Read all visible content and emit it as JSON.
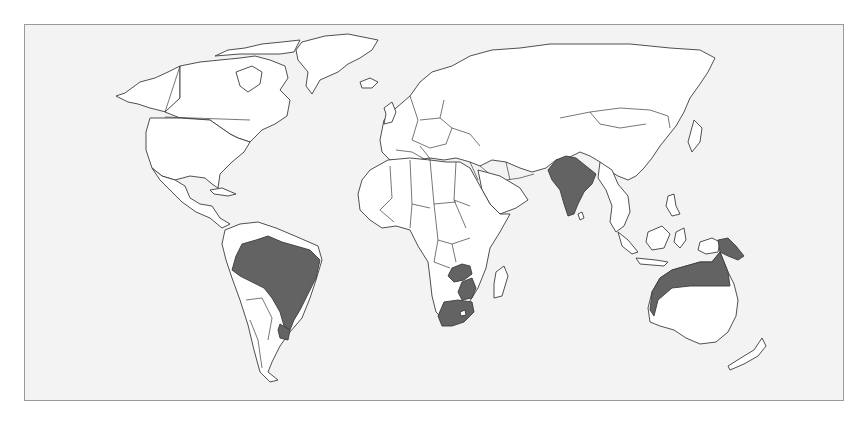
{
  "map": {
    "type": "world-choropleth",
    "projection": "equirectangular-like",
    "colors": {
      "background": "#f3f3f3",
      "land": "#ffffff",
      "highlighted": "#636363",
      "outline": "#3c3c3c",
      "frame": "#9a9a9a"
    },
    "highlighted_regions": [
      "Brazil",
      "Uruguay",
      "Zambia",
      "Zimbabwe",
      "South Africa",
      "India",
      "Papua New Guinea",
      "Northern Australia"
    ],
    "legend": null,
    "title": null
  }
}
